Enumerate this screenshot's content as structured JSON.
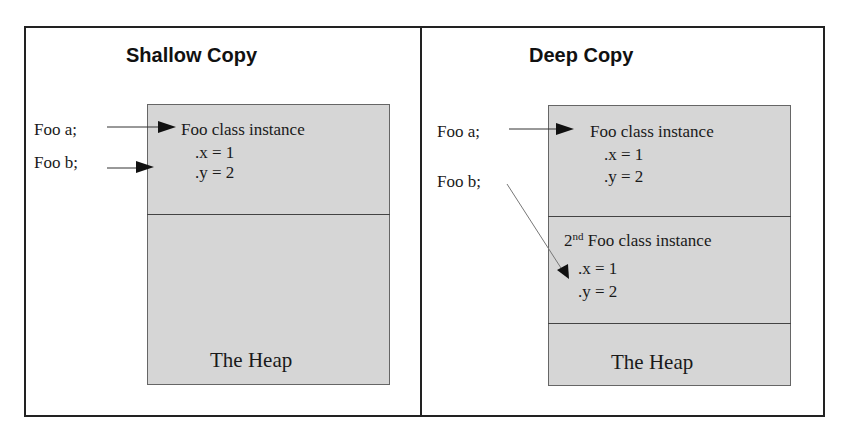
{
  "panels": {
    "shallow": {
      "title": "Shallow Copy",
      "vars": [
        "Foo a;",
        "Foo b;"
      ],
      "instance": {
        "label": "Foo class instance",
        "x": ".x = 1",
        "y": ".y = 2"
      },
      "heap_label": "The Heap"
    },
    "deep": {
      "title": "Deep Copy",
      "vars": [
        "Foo a;",
        "Foo b;"
      ],
      "instance": {
        "label": "Foo class instance",
        "x": ".x = 1",
        "y": ".y = 2"
      },
      "instance2": {
        "ordinal": "2",
        "ordinal_suffix": "nd",
        "label": "Foo class instance",
        "x": ".x = 1",
        "y": ".y = 2"
      },
      "heap_label": "The Heap"
    }
  },
  "colors": {
    "heap_fill": "#d6d6d6",
    "border": "#222222",
    "arrow": "#333333"
  }
}
